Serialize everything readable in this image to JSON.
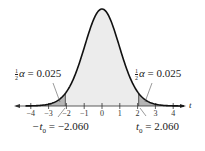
{
  "chart_data": {
    "type": "area",
    "title": "",
    "xlabel": "t",
    "ylabel": "",
    "distribution": "t-distribution (two-tailed)",
    "x_ticks": [
      "-4",
      "-3",
      "-2",
      "-1",
      "0",
      "1",
      "2",
      "3",
      "4"
    ],
    "xlim": [
      -4.3,
      4.6
    ],
    "critical_values": [
      -2.06,
      2.06
    ],
    "tail_area_each": 0.025,
    "annotations": {
      "left_tail": {
        "frac": [
          "1",
          "2"
        ],
        "symbol": "α",
        "eq": " = 0.025"
      },
      "right_tail": {
        "frac": [
          "1",
          "2"
        ],
        "symbol": "α",
        "eq": " = 0.025"
      },
      "left_critical": {
        "prefix": "−t",
        "sub": "0",
        "eq": " = −2.060"
      },
      "right_critical": {
        "prefix": "t",
        "sub": "0",
        "eq": " = 2.060"
      }
    },
    "axis_label": "t",
    "colors": {
      "curve": "#111111",
      "center_fill": "#ececec",
      "tail_fill": "#b5b5b5",
      "axis": "#333333"
    }
  }
}
